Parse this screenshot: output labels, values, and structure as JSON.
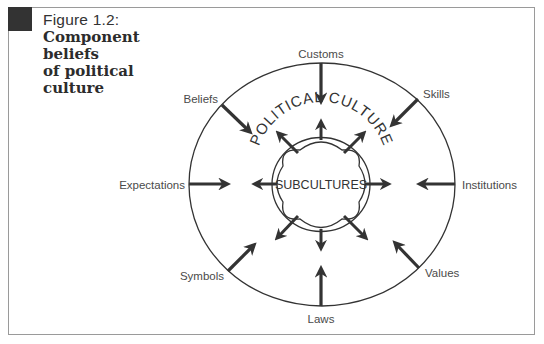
{
  "figure": {
    "label": "Figure 1.2:",
    "title": "Component beliefs of political culture",
    "title_lines": [
      "Component beliefs",
      "of political",
      "culture"
    ]
  },
  "diagram": {
    "outer_label": "POLITICAL CULTURE",
    "inner_label": "SUBCULTURES",
    "components": [
      {
        "name": "Customs",
        "position": "top"
      },
      {
        "name": "Skills",
        "position": "top-right"
      },
      {
        "name": "Institutions",
        "position": "right"
      },
      {
        "name": "Values",
        "position": "bottom-right"
      },
      {
        "name": "Laws",
        "position": "bottom"
      },
      {
        "name": "Symbols",
        "position": "bottom-left"
      },
      {
        "name": "Expectations",
        "position": "left"
      },
      {
        "name": "Beliefs",
        "position": "top-left"
      }
    ],
    "colors": {
      "arrow": "#333333",
      "circle": "#333333",
      "text": "#4a4a4a",
      "corner_block": "#333333",
      "frame_border": "#9a9a9a"
    }
  }
}
